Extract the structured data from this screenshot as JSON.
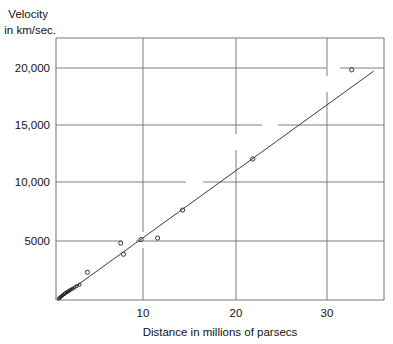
{
  "chart_data": {
    "type": "scatter",
    "title": "",
    "xlabel": "Distance in millions of parsecs",
    "ylabel": "Velocity in km/sec.",
    "ylabel_line1": "Velocity",
    "ylabel_line2": "in km/sec.",
    "xlim": [
      0,
      35.5
    ],
    "ylim": [
      0,
      22200
    ],
    "grid": true,
    "legend": false,
    "xticks": [
      10,
      20,
      30
    ],
    "xtick_labels": [
      "10",
      "20",
      "30"
    ],
    "yticks": [
      5000,
      10000,
      15000,
      20000
    ],
    "ytick_labels": [
      "5000",
      "10,000",
      "15,000",
      "20,000"
    ],
    "series": [
      {
        "name": "Galaxies",
        "marker": "open-circle",
        "x": [
          0.32,
          0.45,
          0.6,
          0.75,
          0.9,
          1.0,
          1.15,
          1.3,
          1.45,
          1.6,
          1.8,
          2.0,
          2.25,
          2.55,
          3.4,
          7.0,
          7.3,
          9.2,
          11.0,
          13.7,
          21.3,
          32.0
        ],
        "y": [
          130,
          220,
          320,
          420,
          500,
          580,
          650,
          720,
          800,
          880,
          960,
          1060,
          1180,
          1300,
          2350,
          4820,
          3880,
          5120,
          5250,
          7620,
          11950,
          19500
        ]
      }
    ],
    "trend_line": {
      "name": "Hubble fit line",
      "x_start": 0.2,
      "y_start": 60,
      "x_end": 34.4,
      "y_end": 19400,
      "slope_km_per_sec_per_mpc": 565
    }
  },
  "axes": {
    "y_title_line1": "Velocity",
    "y_title_line2": "in km/sec.",
    "x_title": "Distance in millions of parsecs",
    "y_tick_20000": "20,000",
    "y_tick_15000": "15,000",
    "y_tick_10000": "10,000",
    "y_tick_5000": "5000",
    "x_tick_10": "10",
    "x_tick_20": "20",
    "x_tick_30": "30"
  },
  "colors": {
    "frame": "#7a7a7a",
    "grid": "#6f6f6f",
    "trend": "#3a3a3a",
    "marker": "#242424",
    "text": "#111111",
    "background": "#ffffff"
  }
}
